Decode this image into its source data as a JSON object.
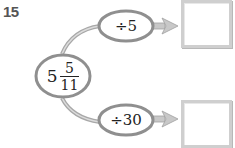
{
  "problem": {
    "number": "15"
  },
  "start_value": {
    "whole": "5",
    "numerator": "5",
    "denominator": "11"
  },
  "operations": [
    {
      "label": "÷5",
      "answer": ""
    },
    {
      "label": "÷30",
      "answer": ""
    }
  ],
  "colors": {
    "stroke": "#9a9a9a",
    "ellipse_fill": "#ffffff",
    "arrow_fill": "#c8c8c8",
    "box_border": "#cfcfcf"
  }
}
